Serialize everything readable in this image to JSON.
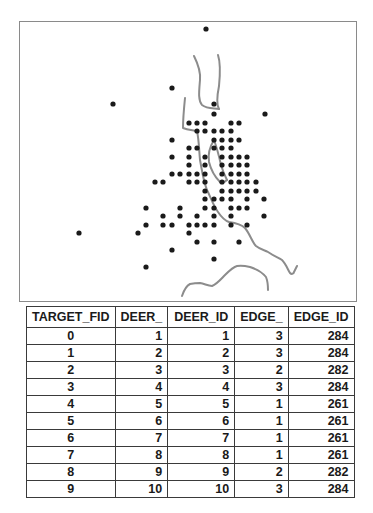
{
  "map": {
    "frame_border_color": "#8a8a8a",
    "river_color": "#8c8c8c",
    "dot_color": "#1a1a1a",
    "points": [
      [
        206,
        29
      ],
      [
        172,
        88
      ],
      [
        113,
        104
      ],
      [
        214,
        104
      ],
      [
        214,
        114
      ],
      [
        265,
        114
      ],
      [
        189,
        123
      ],
      [
        197,
        123
      ],
      [
        205,
        123
      ],
      [
        231,
        123
      ],
      [
        239,
        123
      ],
      [
        197,
        131
      ],
      [
        205,
        131
      ],
      [
        214,
        131
      ],
      [
        222,
        131
      ],
      [
        231,
        131
      ],
      [
        172,
        140
      ],
      [
        214,
        140
      ],
      [
        222,
        140
      ],
      [
        231,
        140
      ],
      [
        239,
        140
      ],
      [
        189,
        148
      ],
      [
        197,
        148
      ],
      [
        214,
        148
      ],
      [
        222,
        148
      ],
      [
        231,
        148
      ],
      [
        172,
        157
      ],
      [
        189,
        157
      ],
      [
        205,
        157
      ],
      [
        222,
        157
      ],
      [
        231,
        157
      ],
      [
        239,
        157
      ],
      [
        247,
        157
      ],
      [
        189,
        165
      ],
      [
        205,
        165
      ],
      [
        222,
        165
      ],
      [
        231,
        165
      ],
      [
        239,
        165
      ],
      [
        247,
        165
      ],
      [
        172,
        174
      ],
      [
        180,
        174
      ],
      [
        189,
        174
      ],
      [
        197,
        174
      ],
      [
        205,
        174
      ],
      [
        222,
        174
      ],
      [
        231,
        174
      ],
      [
        239,
        174
      ],
      [
        247,
        174
      ],
      [
        155,
        182
      ],
      [
        163,
        182
      ],
      [
        189,
        182
      ],
      [
        197,
        182
      ],
      [
        205,
        182
      ],
      [
        222,
        182
      ],
      [
        231,
        182
      ],
      [
        239,
        182
      ],
      [
        247,
        182
      ],
      [
        256,
        182
      ],
      [
        205,
        191
      ],
      [
        222,
        191
      ],
      [
        231,
        191
      ],
      [
        239,
        191
      ],
      [
        247,
        191
      ],
      [
        256,
        191
      ],
      [
        205,
        199
      ],
      [
        214,
        199
      ],
      [
        222,
        199
      ],
      [
        231,
        199
      ],
      [
        247,
        199
      ],
      [
        264,
        199
      ],
      [
        146,
        208
      ],
      [
        180,
        208
      ],
      [
        205,
        208
      ],
      [
        214,
        208
      ],
      [
        231,
        208
      ],
      [
        239,
        208
      ],
      [
        247,
        208
      ],
      [
        163,
        216
      ],
      [
        180,
        216
      ],
      [
        197,
        216
      ],
      [
        214,
        216
      ],
      [
        231,
        216
      ],
      [
        264,
        216
      ],
      [
        146,
        225
      ],
      [
        163,
        225
      ],
      [
        172,
        225
      ],
      [
        189,
        225
      ],
      [
        197,
        225
      ],
      [
        205,
        225
      ],
      [
        214,
        225
      ],
      [
        231,
        225
      ],
      [
        247,
        225
      ],
      [
        79,
        233
      ],
      [
        138,
        233
      ],
      [
        189,
        233
      ],
      [
        197,
        242
      ],
      [
        214,
        242
      ],
      [
        239,
        242
      ],
      [
        172,
        250
      ],
      [
        214,
        259
      ],
      [
        146,
        267
      ]
    ],
    "rivers": [
      "M194,56 C197,62 201,70 200,80 C199,92 198,100 202,105 C207,109 214,108 219,109",
      "M218,55 C221,64 220,76 219,86 C217,96 216,104 219,109",
      "M185,98 C184,108 183,118 183,128 C188,130 193,130 197,131 C199,140 199,150 200,160 C202,170 203,180 207,190 C211,198 213,205 218,212 C222,218 226,221 229,222 C236,223 241,224 245,228 C250,234 252,242 256,246 C261,250 265,250 268,252 C274,256 279,258 282,260 C286,264 288,270 290,273 C292,275 294,273 294,272 C295,270 296,268 297,266",
      "M214,140 C209,148 208,156 209,162 C211,170 214,176 220,182 C224,183 226,181 227,180",
      "M214,140 C217,148 219,156 221,165 C223,172 225,176 227,180",
      "M182,296 C184,290 186,286 190,284 C195,283 198,283 200,283 C205,284 208,286 212,286 C217,284 221,279 225,275 C229,271 233,267 237,266 C242,265 246,266 250,267 C256,269 262,272 266,277 C268,282 268,286 268,290"
    ]
  },
  "table": {
    "columns": [
      "TARGET_FID",
      "DEER_",
      "DEER_ID",
      "EDGE_",
      "EDGE_ID"
    ],
    "rows": [
      [
        "0",
        "1",
        "1",
        "3",
        "284"
      ],
      [
        "1",
        "2",
        "2",
        "3",
        "284"
      ],
      [
        "2",
        "3",
        "3",
        "2",
        "282"
      ],
      [
        "3",
        "4",
        "4",
        "3",
        "284"
      ],
      [
        "4",
        "5",
        "5",
        "1",
        "261"
      ],
      [
        "5",
        "6",
        "6",
        "1",
        "261"
      ],
      [
        "6",
        "7",
        "7",
        "1",
        "261"
      ],
      [
        "7",
        "8",
        "8",
        "1",
        "261"
      ],
      [
        "8",
        "9",
        "9",
        "2",
        "282"
      ],
      [
        "9",
        "10",
        "10",
        "3",
        "284"
      ]
    ]
  }
}
